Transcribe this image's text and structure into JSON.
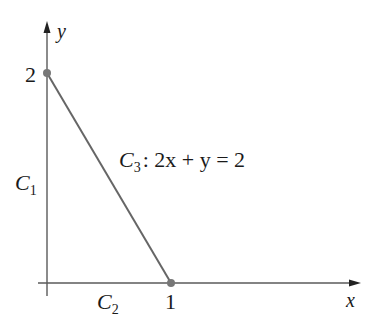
{
  "diagram": {
    "axes": {
      "x_label": "x",
      "y_label": "y",
      "color": "#555555"
    },
    "ticks": {
      "x_tick_label": "1",
      "y_tick_label": "2"
    },
    "points": [
      {
        "name": "point-0-2",
        "coord": [
          0,
          2
        ]
      },
      {
        "name": "point-1-0",
        "coord": [
          1,
          0
        ]
      }
    ],
    "curves": {
      "c1": {
        "name": "C",
        "sub": "1",
        "description": "segment on y-axis from (0,0) to (0,2)"
      },
      "c2": {
        "name": "C",
        "sub": "2",
        "description": "segment on x-axis from (0,0) to (1,0)"
      },
      "c3": {
        "name": "C",
        "sub": "3",
        "equation_rest": ": 2x + y = 2",
        "description": "segment from (1,0) to (0,2)"
      }
    },
    "colors": {
      "line": "#666666",
      "point": "#777777",
      "text": "#1a1a1a"
    }
  }
}
